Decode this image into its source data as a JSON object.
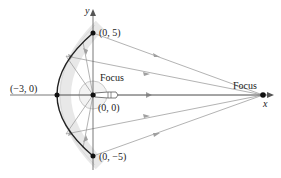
{
  "diagram": {
    "type": "parabolic-reflector",
    "axes": {
      "x_label": "x",
      "y_label": "y"
    },
    "points": [
      {
        "id": "top",
        "label": "(0, 5)"
      },
      {
        "id": "vertex",
        "label": "(−3, 0)"
      },
      {
        "id": "origin",
        "label": "(0, 0)"
      },
      {
        "id": "bottom",
        "label": "(0, −5)"
      }
    ],
    "focus_labels": {
      "inner": "Focus",
      "outer": "Focus"
    },
    "colors": {
      "curve": "#222222",
      "rays": "#9a9a9a",
      "reflector_band": "#e6e6e6",
      "axis": "#555555"
    }
  }
}
